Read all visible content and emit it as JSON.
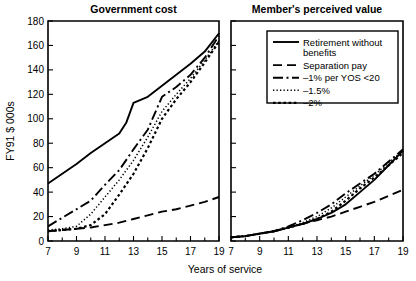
{
  "chart_data": {
    "type": "line",
    "title": "",
    "xlabel": "Years of service",
    "ylabel": "FY91 $ 000s",
    "xlim": [
      7,
      19
    ],
    "ylim": [
      0,
      180
    ],
    "grid": false,
    "xticks_major": [
      7,
      9,
      11,
      13,
      15,
      17,
      19
    ],
    "xticks_minor": [
      8,
      10,
      12,
      14,
      16,
      18
    ],
    "yticks": [
      0,
      20,
      40,
      60,
      80,
      100,
      120,
      140,
      160,
      180
    ],
    "legend_position": "upper-right-of-right-panel",
    "panels": [
      {
        "title": "Government cost",
        "series": [
          {
            "name": "Retirement without benefits",
            "dash": "solid",
            "x": [
              7,
              8,
              9,
              10,
              11,
              12,
              12.5,
              13,
              14,
              15,
              16,
              17,
              18,
              19
            ],
            "values": [
              47,
              55,
              63,
              72,
              80,
              88,
              97,
              113,
              118,
              127,
              136,
              145,
              155,
              170
            ]
          },
          {
            "name": "Separation pay",
            "dash": "dashed",
            "x": [
              7,
              8,
              9,
              10,
              11,
              12,
              13,
              14,
              15,
              16,
              17,
              18,
              19
            ],
            "values": [
              8,
              9,
              10,
              11,
              13,
              15,
              18,
              21,
              24,
              26,
              29,
              32,
              36
            ]
          },
          {
            "name": "-1% per YOS <20",
            "dash": "dashdot",
            "x": [
              7,
              8,
              9,
              10,
              11,
              11.5,
              12,
              13,
              14,
              15,
              16,
              17,
              18,
              19
            ],
            "values": [
              12,
              19,
              26,
              33,
              46,
              52,
              58,
              75,
              91,
              118,
              126,
              136,
              150,
              168
            ]
          },
          {
            "name": "-1.5%",
            "dash": "dotted",
            "x": [
              7,
              8,
              9,
              10,
              11,
              12,
              13,
              14,
              15,
              16,
              17,
              18,
              19
            ],
            "values": [
              9,
              10,
              12,
              22,
              36,
              50,
              66,
              85,
              106,
              120,
              133,
              148,
              164
            ]
          },
          {
            "name": "-2%",
            "dash": "dotted-coarse",
            "x": [
              7,
              8,
              9,
              10,
              11,
              12,
              13,
              14,
              15,
              16,
              17,
              18,
              19
            ],
            "values": [
              8,
              9,
              10,
              13,
              22,
              38,
              55,
              76,
              100,
              116,
              130,
              146,
              163
            ]
          }
        ]
      },
      {
        "title": "Member's perceived value",
        "series": [
          {
            "name": "Retirement without benefits",
            "dash": "solid",
            "x": [
              7,
              8,
              9,
              10,
              11,
              12,
              13,
              14,
              15,
              16,
              17,
              18,
              19
            ],
            "values": [
              3,
              4,
              6,
              8,
              11,
              14,
              18,
              23,
              30,
              40,
              50,
              62,
              74
            ]
          },
          {
            "name": "Separation pay",
            "dash": "dashed",
            "x": [
              7,
              8,
              9,
              10,
              11,
              12,
              13,
              14,
              15,
              16,
              17,
              18,
              19
            ],
            "values": [
              3,
              4,
              6,
              8,
              11,
              14,
              17,
              20,
              24,
              28,
              32,
              37,
              42
            ]
          },
          {
            "name": "-1% per YOS <20",
            "dash": "dashdot",
            "x": [
              7,
              8,
              9,
              10,
              11,
              12,
              13,
              14,
              15,
              16,
              17,
              18,
              19
            ],
            "values": [
              3,
              4,
              6,
              8,
              12,
              17,
              23,
              30,
              39,
              47,
              55,
              65,
              75
            ]
          },
          {
            "name": "-1.5%",
            "dash": "dotted",
            "x": [
              7,
              8,
              9,
              10,
              11,
              12,
              13,
              14,
              15,
              16,
              17,
              18,
              19
            ],
            "values": [
              3,
              4,
              6,
              8,
              11,
              15,
              20,
              27,
              36,
              45,
              54,
              64,
              74
            ]
          },
          {
            "name": "-2%",
            "dash": "dotted-coarse",
            "x": [
              7,
              8,
              9,
              10,
              11,
              12,
              13,
              14,
              15,
              16,
              17,
              18,
              19
            ],
            "values": [
              3,
              4,
              6,
              8,
              11,
              14,
              18,
              24,
              33,
              43,
              52,
              62,
              72
            ]
          }
        ]
      }
    ],
    "legend": [
      {
        "label": "Retirement without",
        "label2": "benefits",
        "dash": "solid"
      },
      {
        "label": "Separation pay",
        "label2": "",
        "dash": "dashed"
      },
      {
        "label": "–1% per YOS <20",
        "label2": "",
        "dash": "dashdot"
      },
      {
        "label": "–1.5%",
        "label2": "",
        "dash": "dotted"
      },
      {
        "label": "–2%",
        "label2": "",
        "dash": "dotted-coarse"
      }
    ]
  }
}
